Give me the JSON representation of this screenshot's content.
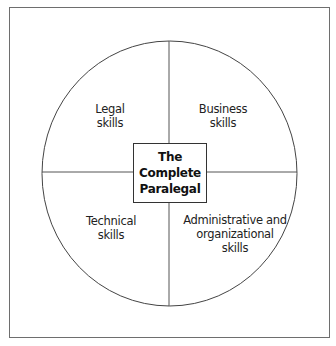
{
  "diagram": {
    "center": {
      "lines": [
        "The",
        "Complete",
        "Paralegal"
      ]
    },
    "quadrants": [
      {
        "position": "top-left",
        "lines": [
          "Legal",
          "skills"
        ]
      },
      {
        "position": "top-right",
        "lines": [
          "Business",
          "skills"
        ]
      },
      {
        "position": "bottom-left",
        "lines": [
          "Technical",
          "skills"
        ]
      },
      {
        "position": "bottom-right",
        "lines": [
          "Administrative and",
          "organizational",
          "skills"
        ]
      }
    ],
    "colors": {
      "stroke": "#333333",
      "frame": "#6e6e6e",
      "background": "#ffffff"
    }
  }
}
